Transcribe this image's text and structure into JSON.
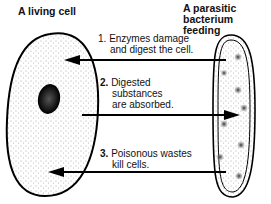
{
  "diagram": {
    "left_title": "A living cell",
    "right_title_line1": "A parasitic",
    "right_title_line2": "bacterium feeding",
    "steps": [
      {
        "number": "1.",
        "line1": "Enzymes damage",
        "line2": "and digest the cell.",
        "direction": "bacterium-to-cell"
      },
      {
        "number": "2.",
        "line1": "Digested",
        "line2": "substances",
        "line3": "are absorbed.",
        "direction": "cell-to-bacterium"
      },
      {
        "number": "3.",
        "line1": "Poisonous wastes",
        "line2": "kill cells.",
        "direction": "bacterium-to-cell"
      }
    ],
    "colors": {
      "ink": "#111111",
      "background": "#ffffff"
    }
  }
}
